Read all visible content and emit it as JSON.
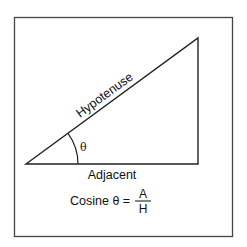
{
  "diagram": {
    "labels": {
      "hypotenuse": "Hypotenuse",
      "adjacent": "Adjacent",
      "angle": "θ"
    },
    "formula": {
      "lhs": "Cosine θ =",
      "numerator": "A",
      "denominator": "H"
    },
    "colors": {
      "stroke": "#222222",
      "frame": "#444444",
      "background": "#ffffff"
    }
  }
}
